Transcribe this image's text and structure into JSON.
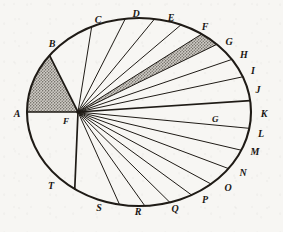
{
  "figure": {
    "center_label": "F",
    "ink_color": "#1f1b16",
    "paper_color": "#f7f6f3",
    "shade_color": "#8d8a84",
    "ellipse": {
      "cx": 139,
      "cy": 112,
      "rx": 112,
      "ry": 94
    },
    "focus": {
      "x": 78,
      "y": 112
    },
    "interior_label": {
      "text": "G",
      "x": 212,
      "y": 122
    },
    "shaded_sectors": [
      {
        "from": "A",
        "to": "B",
        "name": "sector-A-B"
      },
      {
        "from": "G",
        "to": "H",
        "name": "sector-G-H"
      }
    ],
    "thick_radii": [
      "A",
      "B",
      "K",
      "T"
    ],
    "perimeter_points": [
      {
        "label": "A",
        "angle": 180,
        "lx": 17,
        "ly": 117
      },
      {
        "label": "B",
        "angle": 143,
        "lx": 52,
        "ly": 47
      },
      {
        "label": "C",
        "angle": 115,
        "lx": 98,
        "ly": 23
      },
      {
        "label": "D",
        "angle": 97,
        "lx": 136,
        "ly": 17
      },
      {
        "label": "E",
        "angle": 82,
        "lx": 171,
        "ly": 21
      },
      {
        "label": "F",
        "angle": 68,
        "lx": 205,
        "ly": 30
      },
      {
        "label": "G",
        "angle": 56,
        "lx": 229,
        "ly": 45
      },
      {
        "label": "H",
        "angle": 46,
        "lx": 244,
        "ly": 58
      },
      {
        "label": "I",
        "angle": 34,
        "lx": 253,
        "ly": 74
      },
      {
        "label": "J",
        "angle": 22,
        "lx": 258,
        "ly": 93
      },
      {
        "label": "K",
        "angle": 7,
        "lx": 264,
        "ly": 117
      },
      {
        "label": "L",
        "angle": -10,
        "lx": 261,
        "ly": 137
      },
      {
        "label": "M",
        "angle": -24,
        "lx": 255,
        "ly": 155
      },
      {
        "label": "N",
        "angle": -37,
        "lx": 243,
        "ly": 176
      },
      {
        "label": "O",
        "angle": -50,
        "lx": 228,
        "ly": 191
      },
      {
        "label": "P",
        "angle": -62,
        "lx": 205,
        "ly": 203
      },
      {
        "label": "Q",
        "angle": -74,
        "lx": 175,
        "ly": 212
      },
      {
        "label": "R",
        "angle": -87,
        "lx": 138,
        "ly": 215
      },
      {
        "label": "S",
        "angle": -100,
        "lx": 99,
        "ly": 211
      },
      {
        "label": "T",
        "angle": -125,
        "lx": 51,
        "ly": 189
      }
    ]
  }
}
